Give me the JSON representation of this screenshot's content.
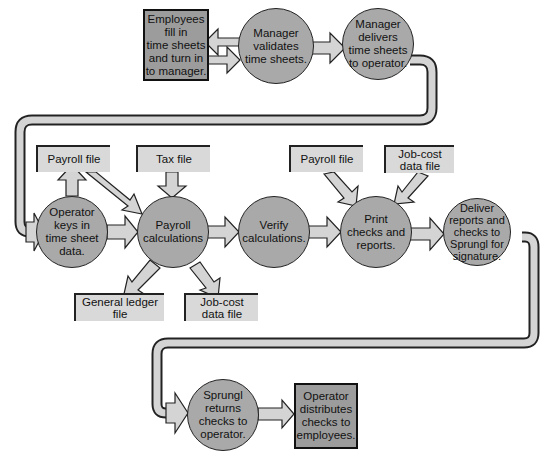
{
  "diagram": {
    "type": "flowchart",
    "colors": {
      "process_circle": "#a9a9a9",
      "terminal_box": "#9c9c9c",
      "file_box": "#d9d9d9",
      "arrow_fill": "#d4d4d4",
      "outline": "#222222"
    },
    "nodes": {
      "employees_fill": {
        "shape": "box",
        "text": "Employees\nfill in\ntime sheets\nand turn in\nto manager."
      },
      "manager_validates": {
        "shape": "circle",
        "text": "Manager\nvalidates\ntime sheets."
      },
      "manager_delivers": {
        "shape": "circle",
        "text": "Manager\ndelivers\ntime sheets\nto operator."
      },
      "payroll_file_1": {
        "shape": "file",
        "text": "Payroll file"
      },
      "tax_file": {
        "shape": "file",
        "text": "Tax file"
      },
      "operator_keys": {
        "shape": "circle",
        "text": "Operator\nkeys in\ntime sheet\ndata."
      },
      "payroll_calc": {
        "shape": "circle",
        "text": "Payroll\ncalculations"
      },
      "verify_calc": {
        "shape": "circle",
        "text": "Verify\ncalculations."
      },
      "payroll_file_2": {
        "shape": "file",
        "text": "Payroll file"
      },
      "jobcost_file_top": {
        "shape": "file",
        "text": "Job-cost\ndata file"
      },
      "print_checks": {
        "shape": "circle",
        "text": "Print\nchecks and\nreports."
      },
      "deliver_reports": {
        "shape": "circle",
        "text": "Deliver\nreports and\nchecks to\nSprungl for\nsignature."
      },
      "general_ledger_file": {
        "shape": "file",
        "text": "General ledger\nfile"
      },
      "jobcost_file_bottom": {
        "shape": "file",
        "text": "Job-cost\ndata file"
      },
      "sprungl_returns": {
        "shape": "circle",
        "text": "Sprungl\nreturns\nchecks to\noperator."
      },
      "operator_distributes": {
        "shape": "box",
        "text": "Operator\ndistributes\nchecks to\nemployees."
      }
    },
    "edges": [
      [
        "employees_fill",
        "manager_validates"
      ],
      [
        "manager_validates",
        "employees_fill"
      ],
      [
        "manager_validates",
        "manager_delivers"
      ],
      [
        "manager_delivers",
        "operator_keys"
      ],
      [
        "operator_keys",
        "payroll_file_1"
      ],
      [
        "operator_keys",
        "payroll_calc"
      ],
      [
        "payroll_file_1",
        "payroll_calc"
      ],
      [
        "tax_file",
        "payroll_calc"
      ],
      [
        "payroll_calc",
        "general_ledger_file"
      ],
      [
        "payroll_calc",
        "jobcost_file_bottom"
      ],
      [
        "payroll_calc",
        "verify_calc"
      ],
      [
        "verify_calc",
        "print_checks"
      ],
      [
        "payroll_file_2",
        "print_checks"
      ],
      [
        "jobcost_file_top",
        "print_checks"
      ],
      [
        "print_checks",
        "deliver_reports"
      ],
      [
        "deliver_reports",
        "sprungl_returns"
      ],
      [
        "sprungl_returns",
        "operator_distributes"
      ]
    ]
  }
}
